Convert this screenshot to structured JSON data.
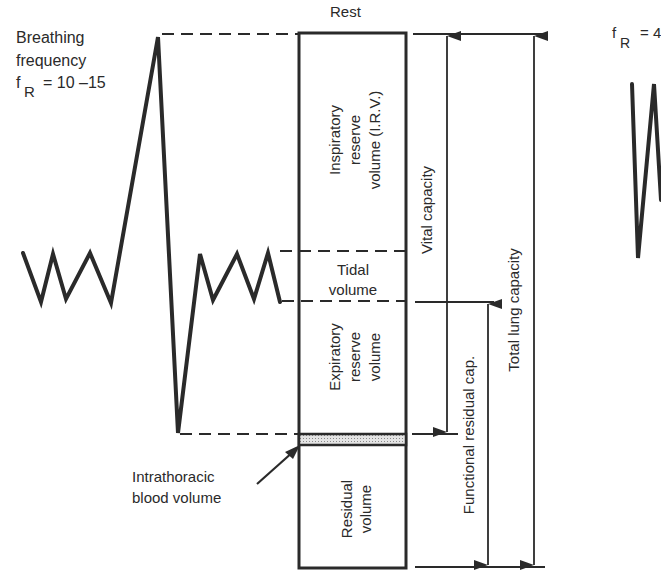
{
  "diagram": {
    "rest_label": "Rest",
    "left_annotation": {
      "line1": "Breathing",
      "line2": "frequency",
      "symbol": "f",
      "subscript": "R",
      "value": "= 10 –15"
    },
    "right_annotation": {
      "symbol": "f",
      "subscript": "R",
      "value": "= 4"
    },
    "volumes": {
      "irv": [
        "Inspiratory",
        "reserve",
        "volume (I.R.V.)"
      ],
      "tidal": [
        "Tidal",
        "volume"
      ],
      "erv": [
        "Expiratory",
        "reserve",
        "volume"
      ],
      "residual": [
        "Residual",
        "volume"
      ]
    },
    "capacities": {
      "vital": "Vital capacity",
      "frc": "Functional residual cap.",
      "tlc": "Total lung capacity"
    },
    "blood_volume": [
      "Intrathoracic",
      "blood volume"
    ],
    "colors": {
      "line": "#2a2a2a",
      "shaded": "#c8c8c8"
    }
  }
}
